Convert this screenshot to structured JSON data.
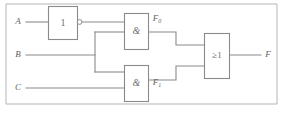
{
  "figure": {
    "background_color": "#ffffff",
    "line_color": "#8a8a8a",
    "text_color": "#5f5f5f"
  },
  "inputs": [
    {
      "name": "input-a",
      "label": "A",
      "x": 18,
      "y": 22
    },
    {
      "name": "input-b",
      "label": "B",
      "x": 18,
      "y": 55
    },
    {
      "name": "input-c",
      "label": "C",
      "x": 18,
      "y": 88
    }
  ],
  "output": {
    "name": "output-f",
    "label": "F",
    "x": 268,
    "y": 55
  },
  "gates": [
    {
      "name": "not-gate",
      "type": "NOT",
      "symbol": "1",
      "inverted_output": true,
      "box": {
        "x": 48,
        "y": 6,
        "width": 29,
        "height": 33
      }
    },
    {
      "name": "and-gate-top",
      "type": "AND",
      "symbol": "&",
      "output_label": "F",
      "output_label_subscript": "0",
      "box": {
        "x": 124,
        "y": 13,
        "width": 24,
        "height": 36
      }
    },
    {
      "name": "and-gate-bottom",
      "type": "AND",
      "symbol": "&",
      "output_label": "F",
      "output_label_subscript": "1",
      "box": {
        "x": 124,
        "y": 65,
        "width": 24,
        "height": 36
      }
    },
    {
      "name": "or-gate",
      "type": "OR",
      "symbol": "≥1",
      "box": {
        "x": 204,
        "y": 33,
        "width": 25,
        "height": 45
      }
    }
  ],
  "intermediate_labels": [
    {
      "name": "label-f0",
      "base": "F",
      "subscript": "0",
      "x": 159,
      "y": 19
    },
    {
      "name": "label-f1",
      "base": "F",
      "subscript": "1",
      "x": 159,
      "y": 83
    }
  ]
}
